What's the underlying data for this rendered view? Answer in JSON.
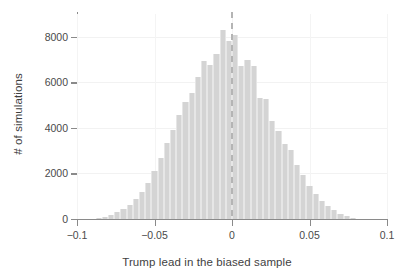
{
  "chart_data": {
    "type": "bar",
    "subtype": "histogram",
    "title": "",
    "xlabel": "Trump lead in the biased sample",
    "ylabel": "# of simulations",
    "xlim": [
      -0.1,
      0.1
    ],
    "ylim": [
      0,
      9000
    ],
    "xticks": [
      -0.1,
      -0.05,
      0,
      0.05,
      0.1
    ],
    "xtick_labels": [
      "−0.1",
      "−0.05",
      "0",
      "0.05",
      "0.1"
    ],
    "yticks": [
      0,
      2000,
      4000,
      6000,
      8000
    ],
    "ytick_labels": [
      "0",
      "2000",
      "4000",
      "6000",
      "8000"
    ],
    "grid": true,
    "legend": null,
    "bar_color": "#d4d4d4",
    "bar_edge_color": "#e6e6e6",
    "axis_color": "#8a8a8a",
    "grid_color": "#f2f2f2",
    "text_color": "#3f3f3f",
    "annotations": [
      {
        "type": "vline",
        "name": "zero-reference-line",
        "x": 0,
        "style": "dashed",
        "color": "#b4b4b4"
      }
    ],
    "bin_width": 0.004,
    "bin_centers": [
      -0.086,
      -0.082,
      -0.078,
      -0.074,
      -0.07,
      -0.066,
      -0.062,
      -0.058,
      -0.054,
      -0.05,
      -0.046,
      -0.042,
      -0.038,
      -0.034,
      -0.03,
      -0.026,
      -0.022,
      -0.018,
      -0.014,
      -0.01,
      -0.006,
      -0.002,
      0.002,
      0.006,
      0.01,
      0.014,
      0.018,
      0.022,
      0.026,
      0.03,
      0.034,
      0.038,
      0.042,
      0.046,
      0.05,
      0.054,
      0.058,
      0.062,
      0.066,
      0.07,
      0.074,
      0.078
    ],
    "values": [
      40,
      90,
      170,
      290,
      430,
      620,
      900,
      1180,
      1600,
      2100,
      2700,
      3350,
      3900,
      4550,
      5150,
      5550,
      6250,
      6950,
      6750,
      7250,
      8300,
      7800,
      8100,
      6700,
      7000,
      6700,
      5300,
      5250,
      4300,
      3850,
      3300,
      3050,
      2350,
      1950,
      1450,
      1100,
      800,
      560,
      380,
      240,
      130,
      60
    ]
  },
  "figure": {
    "background_color": "#ffffff"
  }
}
